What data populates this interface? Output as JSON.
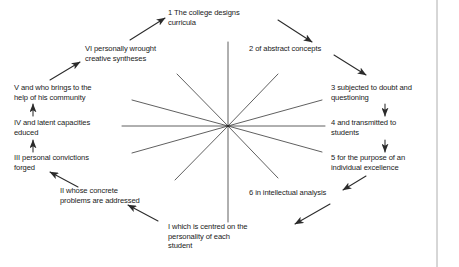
{
  "diagram": {
    "type": "radial-cycle",
    "hub": {
      "x": 228,
      "y": 126
    },
    "border_rule": {
      "x": 437,
      "color": "#9a9a9a"
    },
    "line_color": "#2b2b2b",
    "text_color": "#1a1a1a",
    "nodes": [
      {
        "id": "n1",
        "key": "1",
        "label": "1  The college designs\ncurricula",
        "x": 168,
        "y": 8,
        "align": "left",
        "width": 130,
        "spoke_end": {
          "x": 228,
          "y": 42
        }
      },
      {
        "id": "n2",
        "key": "2",
        "label": "2  of abstract concepts",
        "x": 249,
        "y": 44,
        "align": "left",
        "width": 120,
        "spoke_end": {
          "x": 278,
          "y": 74
        }
      },
      {
        "id": "n3",
        "key": "3",
        "label": "3  subjected to doubt and\nquestioning",
        "x": 331,
        "y": 83,
        "align": "left",
        "width": 110,
        "spoke_end": {
          "x": 322,
          "y": 100
        }
      },
      {
        "id": "n4",
        "key": "4",
        "label": "4  and transmitted to\nstudents",
        "x": 331,
        "y": 118,
        "align": "left",
        "width": 110,
        "spoke_end": {
          "x": 325,
          "y": 126
        }
      },
      {
        "id": "n5",
        "key": "5",
        "label": "5  for the purpose of an\nindividual excellence",
        "x": 331,
        "y": 153,
        "align": "left",
        "width": 110,
        "spoke_end": {
          "x": 322,
          "y": 152
        }
      },
      {
        "id": "n6",
        "key": "6",
        "label": "6  in intellectual analysis",
        "x": 249,
        "y": 188,
        "align": "left",
        "width": 120,
        "spoke_end": {
          "x": 278,
          "y": 178
        }
      },
      {
        "id": "nI",
        "key": "I",
        "label": "I which is centred on the\npersonality of each\nstudent",
        "x": 168,
        "y": 222,
        "align": "left",
        "width": 130,
        "spoke_end": {
          "x": 228,
          "y": 222
        }
      },
      {
        "id": "nII",
        "key": "II",
        "label": "II whose concrete\nproblems are addressed",
        "x": 60,
        "y": 186,
        "align": "left",
        "width": 118,
        "spoke_end": {
          "x": 175,
          "y": 180
        }
      },
      {
        "id": "nIII",
        "key": "III",
        "label": "III personal convictions\nforged",
        "x": 14,
        "y": 153,
        "align": "left",
        "width": 118,
        "spoke_end": {
          "x": 132,
          "y": 153
        }
      },
      {
        "id": "nIV",
        "key": "IV",
        "label": "IV and latent capacities\neduced",
        "x": 14,
        "y": 118,
        "align": "left",
        "width": 118,
        "spoke_end": {
          "x": 122,
          "y": 126
        }
      },
      {
        "id": "nV",
        "key": "V",
        "label": "V and who brings to the\nhelp of his community",
        "x": 14,
        "y": 83,
        "align": "left",
        "width": 118,
        "spoke_end": {
          "x": 132,
          "y": 100
        }
      },
      {
        "id": "nVI",
        "key": "VI",
        "label": "VI personally wrought\ncreative syntheses",
        "x": 85,
        "y": 44,
        "align": "left",
        "width": 118,
        "spoke_end": {
          "x": 177,
          "y": 74
        }
      }
    ],
    "spokes": [
      {
        "id": "s-up",
        "from": "hub",
        "to": {
          "x": 228,
          "y": 42
        }
      },
      {
        "id": "s-n2",
        "from": "hub",
        "to": {
          "x": 278,
          "y": 74
        }
      },
      {
        "id": "s-n3",
        "from": "hub",
        "to": {
          "x": 322,
          "y": 100
        }
      },
      {
        "id": "s-right",
        "from": "hub",
        "to": {
          "x": 325,
          "y": 126
        }
      },
      {
        "id": "s-n5",
        "from": "hub",
        "to": {
          "x": 322,
          "y": 152
        }
      },
      {
        "id": "s-n6",
        "from": "hub",
        "to": {
          "x": 278,
          "y": 178
        }
      },
      {
        "id": "s-down",
        "from": "hub",
        "to": {
          "x": 228,
          "y": 222
        }
      },
      {
        "id": "s-nII",
        "from": "hub",
        "to": {
          "x": 175,
          "y": 180
        }
      },
      {
        "id": "s-nIII",
        "from": "hub",
        "to": {
          "x": 132,
          "y": 153
        }
      },
      {
        "id": "s-left",
        "from": "hub",
        "to": {
          "x": 122,
          "y": 126
        }
      },
      {
        "id": "s-nV",
        "from": "hub",
        "to": {
          "x": 132,
          "y": 100
        }
      },
      {
        "id": "s-nVI",
        "from": "hub",
        "to": {
          "x": 177,
          "y": 74
        }
      }
    ],
    "arrows": [
      {
        "id": "a-VI-1",
        "from_node": "nVI",
        "to_node": "n1",
        "x1": 130,
        "y1": 40,
        "x2": 165,
        "y2": 18
      },
      {
        "id": "a-1-2",
        "from_node": "n1",
        "to_node": "n2",
        "x1": 278,
        "y1": 20,
        "x2": 312,
        "y2": 42
      },
      {
        "id": "a-2-3",
        "from_node": "n2",
        "to_node": "n3",
        "x1": 334,
        "y1": 55,
        "x2": 366,
        "y2": 75
      },
      {
        "id": "a-3-4",
        "from_node": "n3",
        "to_node": "n4",
        "x1": 385,
        "y1": 104,
        "x2": 385,
        "y2": 116
      },
      {
        "id": "a-4-5",
        "from_node": "n4",
        "to_node": "n5",
        "x1": 385,
        "y1": 140,
        "x2": 385,
        "y2": 152
      },
      {
        "id": "a-5-6",
        "from_node": "n5",
        "to_node": "n6",
        "x1": 366,
        "y1": 176,
        "x2": 343,
        "y2": 190
      },
      {
        "id": "a-6-I",
        "from_node": "n6",
        "to_node": "nI",
        "x1": 330,
        "y1": 204,
        "x2": 295,
        "y2": 224
      },
      {
        "id": "a-I-II",
        "from_node": "nI",
        "to_node": "nII",
        "x1": 158,
        "y1": 221,
        "x2": 128,
        "y2": 205
      },
      {
        "id": "a-II-III",
        "from_node": "nII",
        "to_node": "nIII",
        "x1": 78,
        "y1": 187,
        "x2": 50,
        "y2": 172
      },
      {
        "id": "a-III-IV",
        "from_node": "nIII",
        "to_node": "nIV",
        "x1": 33,
        "y1": 152,
        "x2": 33,
        "y2": 140
      },
      {
        "id": "a-IV-V",
        "from_node": "nIV",
        "to_node": "nV",
        "x1": 33,
        "y1": 116,
        "x2": 33,
        "y2": 104
      },
      {
        "id": "a-V-VI",
        "from_node": "nV",
        "to_node": "nVI",
        "x1": 50,
        "y1": 80,
        "x2": 80,
        "y2": 62
      }
    ]
  }
}
